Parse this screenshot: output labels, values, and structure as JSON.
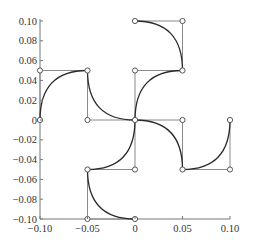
{
  "chart_data": {
    "type": "line",
    "title": "",
    "xlabel": "",
    "ylabel": "",
    "xlim": [
      -0.1,
      0.1
    ],
    "ylim": [
      -0.1,
      0.1
    ],
    "grid": false,
    "legend": null,
    "x_ticks": [
      -0.1,
      -0.05,
      0,
      0.05,
      0.1
    ],
    "x_tick_labels": [
      "−0.10",
      "−0.05",
      "0",
      "0.05",
      "0.10"
    ],
    "y_ticks": [
      0.1,
      0.08,
      0.06,
      0.04,
      0.02,
      0,
      -0.02,
      -0.04,
      -0.06,
      -0.08,
      -0.1
    ],
    "y_tick_labels": [
      "0.10",
      "0.08",
      "0.06",
      "0.04",
      "0.02",
      "0",
      "−0.02",
      "−0.04",
      "−0.06",
      "−0.08",
      "−0.10"
    ],
    "series": [
      {
        "name": "arm-up-right-1",
        "start": [
          0,
          0
        ],
        "control": [
          0,
          0.05
        ],
        "end": [
          0.05,
          0.05
        ]
      },
      {
        "name": "arm-up-right-2",
        "start": [
          0.05,
          0.05
        ],
        "control": [
          0.05,
          0.1
        ],
        "end": [
          0,
          0.1
        ]
      },
      {
        "name": "arm-left-1",
        "start": [
          0,
          0
        ],
        "control": [
          -0.05,
          0
        ],
        "end": [
          -0.05,
          0.05
        ]
      },
      {
        "name": "arm-left-2",
        "start": [
          -0.05,
          0.05
        ],
        "control": [
          -0.1,
          0.05
        ],
        "end": [
          -0.1,
          0
        ]
      },
      {
        "name": "arm-right-1",
        "start": [
          0,
          0
        ],
        "control": [
          0.05,
          0
        ],
        "end": [
          0.05,
          -0.05
        ]
      },
      {
        "name": "arm-right-2",
        "start": [
          0.05,
          -0.05
        ],
        "control": [
          0.1,
          -0.05
        ],
        "end": [
          0.1,
          0
        ]
      },
      {
        "name": "arm-down-1",
        "start": [
          0,
          0
        ],
        "control": [
          0,
          -0.05
        ],
        "end": [
          -0.05,
          -0.05
        ]
      },
      {
        "name": "arm-down-2",
        "start": [
          -0.05,
          -0.05
        ],
        "control": [
          -0.05,
          -0.1
        ],
        "end": [
          0,
          -0.1
        ]
      }
    ]
  },
  "colors": {
    "curve": "#2a2a2a",
    "control_polygon": "#8a8a8a",
    "axis": "#777777",
    "marker_fill": "#ffffff"
  }
}
